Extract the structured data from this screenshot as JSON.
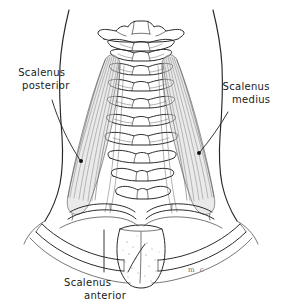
{
  "figure": {
    "background_color": "#ffffff",
    "ink_color": "#2b2b2b",
    "muscle_shade_color": "#d9d9d9",
    "width": 282,
    "height": 303
  },
  "labels": {
    "posterior": {
      "line1": "Scalenus",
      "line2": "posterior",
      "side": "left"
    },
    "medius": {
      "line1": "Scalenus",
      "line2": "medius",
      "side": "right"
    },
    "anterior": {
      "line1": "Scalenus",
      "line2": "anterior",
      "side": "bottom"
    }
  },
  "signature": {
    "monogram": "m c"
  },
  "structures": [
    {
      "name": "atlas-vertebra",
      "label": "C1 atlas with transverse processes"
    },
    {
      "name": "axis-vertebra",
      "label": "C2 axis"
    },
    {
      "name": "cervical-vertebrae",
      "label": "cervical vertebral column C3-C7"
    },
    {
      "name": "scalenus-anterior-muscle",
      "label": "scalenus anterior"
    },
    {
      "name": "scalenus-medius-muscle",
      "label": "scalenus medius"
    },
    {
      "name": "scalenus-posterior-muscle",
      "label": "scalenus posterior"
    },
    {
      "name": "first-rib-left",
      "label": "left first rib"
    },
    {
      "name": "first-rib-right",
      "label": "right first rib"
    },
    {
      "name": "manubrium-sterni",
      "label": "manubrium of sternum"
    },
    {
      "name": "clavicle-left",
      "label": "left clavicle"
    },
    {
      "name": "clavicle-right",
      "label": "right clavicle"
    },
    {
      "name": "neck-contour-left",
      "label": "left neck skin contour"
    },
    {
      "name": "neck-contour-right",
      "label": "right neck skin contour"
    }
  ]
}
